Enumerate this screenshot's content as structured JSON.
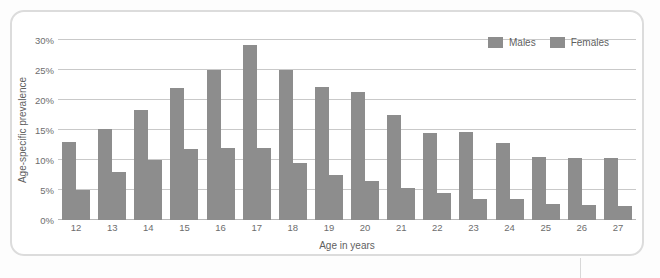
{
  "chart_data": {
    "type": "bar",
    "title": "",
    "xlabel": "Age in years",
    "ylabel": "Age-specific prevalence",
    "categories": [
      "12",
      "13",
      "14",
      "15",
      "16",
      "17",
      "18",
      "19",
      "20",
      "21",
      "22",
      "23",
      "24",
      "25",
      "26",
      "27"
    ],
    "series": [
      {
        "name": "Males",
        "values": [
          13.0,
          15.2,
          18.3,
          22.0,
          25.0,
          29.2,
          25.0,
          22.2,
          21.3,
          17.5,
          14.5,
          14.7,
          12.8,
          10.5,
          10.4,
          10.4
        ]
      },
      {
        "name": "Females",
        "values": [
          5.0,
          8.0,
          10.0,
          11.8,
          12.0,
          12.0,
          9.5,
          7.5,
          6.5,
          5.3,
          4.5,
          3.5,
          3.5,
          2.7,
          2.5,
          2.3
        ]
      }
    ],
    "ylim": [
      0,
      30
    ],
    "yticks": [
      "0%",
      "5%",
      "10%",
      "15%",
      "20%",
      "25%",
      "30%"
    ],
    "ytick_values": [
      0,
      5,
      10,
      15,
      20,
      25,
      30
    ],
    "grid": true,
    "legend_position": "top-right",
    "colors": {
      "males": "#8d8d8d",
      "females": "#8d8d8d",
      "gridline": "#c9c9c9",
      "panel_border": "#dcdcdc"
    }
  },
  "legend": {
    "items": [
      {
        "label": "Males"
      },
      {
        "label": "Females"
      }
    ]
  }
}
